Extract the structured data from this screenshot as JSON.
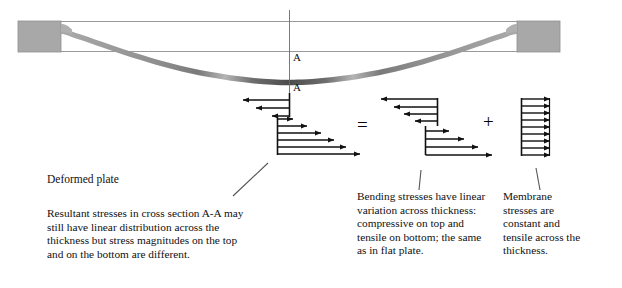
{
  "figure": {
    "section_label_top": "A",
    "section_label_bottom": "A",
    "operator_equals": "=",
    "operator_plus": "+"
  },
  "captions": {
    "deformed_plate": "Deformed plate",
    "resultant": "Resultant stresses in cross section A-A may still have linear distribution across the thickness but stress magnitudes on the top and on the bottom are different.",
    "bending": "Bending stresses have linear variation across thickness: compressive on top and tensile on bottom; the same as in flat plate.",
    "membrane": "Membrane stresses are constant and tensile across the thickness."
  },
  "colors": {
    "support_block": "#a8a8a8",
    "support_block_edge": "#8f8f8f",
    "plate_outline": "#9a9a9a",
    "beam_light": "#b9b9b9",
    "beam_mid": "#8a8a8a",
    "beam_dark": "#4f4f4f",
    "arrow": "#111111",
    "text": "#111111",
    "leader": "#555555"
  },
  "diagrams": {
    "resultant": {
      "name": "Resultant stresses",
      "type": "stress-distribution",
      "compressive_arrow_lengths": [
        36,
        26,
        13
      ],
      "tensile_arrow_lengths": [
        14,
        28,
        42,
        54,
        66,
        80
      ],
      "note": "Left-pointing arrows above neutral axis, right-pointing below; neutral axis shifted upward."
    },
    "bending": {
      "name": "Bending stresses",
      "type": "stress-distribution",
      "compressive_arrow_lengths": [
        56,
        43,
        33,
        22
      ],
      "tensile_arrow_lengths": [
        23,
        38,
        52,
        66
      ],
      "note": "Antisymmetric linear variation: compressive on top, tensile on bottom."
    },
    "membrane": {
      "name": "Membrane stresses",
      "type": "uniform-stress",
      "arrow_count": 9,
      "arrow_length": 28,
      "note": "All arrows equal length pointing right; constant tensile stress."
    }
  }
}
